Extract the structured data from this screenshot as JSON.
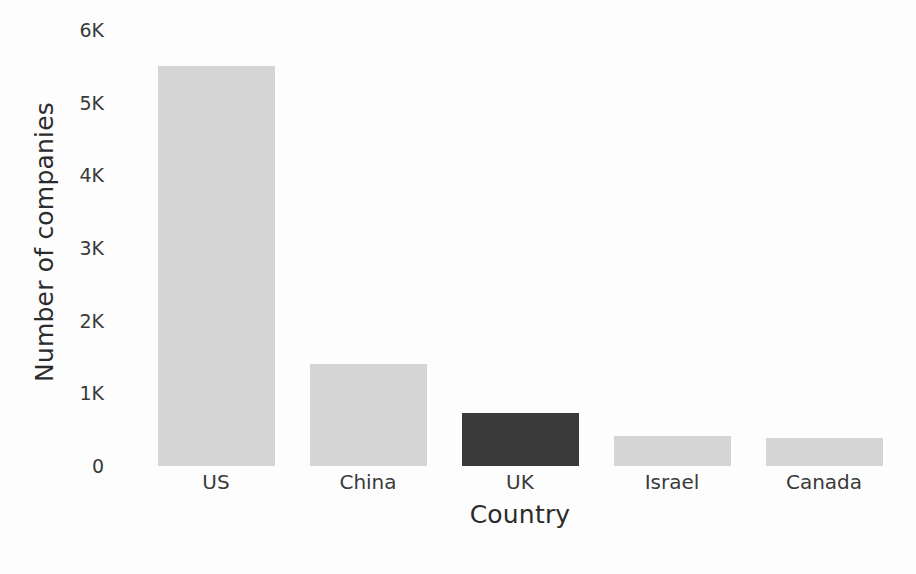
{
  "chart_data": {
    "type": "bar",
    "title": "",
    "subtitle": "",
    "xlabel": "Country",
    "ylabel": "Number of companies",
    "categories": [
      "US",
      "China",
      "UK",
      "Israel",
      "Canada"
    ],
    "values": [
      5500,
      1400,
      730,
      410,
      385
    ],
    "ylim": [
      0,
      6000
    ],
    "yticks": [
      0,
      1000,
      2000,
      3000,
      4000,
      5000,
      6000
    ],
    "ytick_labels": [
      "0",
      "1K",
      "2K",
      "3K",
      "4K",
      "5K",
      "6K"
    ],
    "grid": false,
    "legend": null,
    "bar_colors": [
      "#d5d5d5",
      "#d5d5d5",
      "#3a3a3a",
      "#d5d5d5",
      "#d5d5d5"
    ],
    "highlight_category": "UK",
    "annotations": []
  },
  "colors": {
    "background": "#fdfdfd",
    "bar_light": "#d5d5d5",
    "bar_dark": "#3a3a3a",
    "tick_text": "#3a3a3a",
    "axis_label_text": "#2b2b2b"
  }
}
